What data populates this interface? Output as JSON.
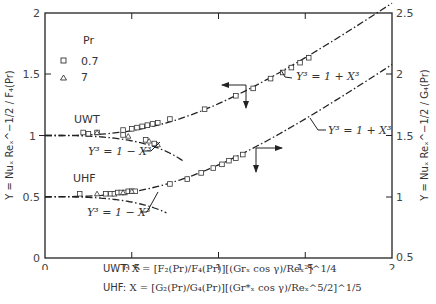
{
  "chart_data": {
    "type": "scatter",
    "title": "",
    "xlabel": "X",
    "ylabel_left": "Y = Nu_x Re_x^{-1/2} / F_4(Pr)",
    "ylabel_right": "Y = Nu_x Re_x^{-1/2} / G_4(Pr)",
    "xlim": [
      0,
      2
    ],
    "ylim_left": [
      0,
      2
    ],
    "ylim_right": [
      0.5,
      2.5
    ],
    "x_ticks": [
      "0",
      "0.5",
      "1",
      "1.5",
      "2"
    ],
    "y_ticks_left": [
      "0",
      "0.5",
      "1",
      "1.5",
      "2"
    ],
    "y_ticks_right": [
      "0.5",
      "1",
      "1.5",
      "2",
      "2.5"
    ],
    "legend": {
      "title": "Pr",
      "entries": [
        {
          "marker": "square",
          "label": "0.7"
        },
        {
          "marker": "triangle",
          "label": "7"
        }
      ]
    },
    "curves": [
      {
        "name": "UWT: Y^3 = 1 + X^3",
        "axis": "left",
        "style": "dash-dot",
        "formula": "Y=(1+X^3)^(1/3)",
        "x_range": [
          0,
          2
        ]
      },
      {
        "name": "UWT: Y^3 = 1 - X^3",
        "axis": "left",
        "style": "dash-dot",
        "formula": "Y=(1-X^3)^(1/3)",
        "x_range": [
          0,
          0.8
        ]
      },
      {
        "name": "UHF: Y^3 = 1 + X^3",
        "axis": "right",
        "style": "dash-dot",
        "formula": "Y=(1+X^3)^(1/3)",
        "x_range": [
          0,
          2
        ]
      },
      {
        "name": "UHF: Y^3 = 1 - X^3",
        "axis": "right",
        "style": "dash-dot",
        "formula": "Y=(1-X^3)^(1/3)",
        "x_range": [
          0,
          0.7
        ]
      }
    ],
    "series": [
      {
        "name": "UWT aiding, Pr=0.7",
        "axis": "left",
        "marker": "square",
        "x": [
          0.22,
          0.3,
          0.45,
          0.5,
          0.53,
          0.56,
          0.59,
          0.62,
          0.65,
          0.72,
          0.92,
          1.1,
          1.2,
          1.3,
          1.37,
          1.42,
          1.47,
          1.52
        ],
        "y": [
          1.0,
          1.0,
          1.02,
          1.03,
          1.04,
          1.05,
          1.06,
          1.07,
          1.08,
          1.11,
          1.19,
          1.3,
          1.36,
          1.44,
          1.49,
          1.53,
          1.57,
          1.61
        ]
      },
      {
        "name": "UWT opposing, Pr=0.7",
        "axis": "left",
        "marker": "square",
        "x": [
          0.25,
          0.45,
          0.58,
          0.63
        ],
        "y": [
          0.99,
          0.98,
          0.94,
          0.91
        ]
      },
      {
        "name": "UWT opposing, Pr=7",
        "axis": "left",
        "marker": "triangle",
        "x": [
          0.3,
          0.48,
          0.6,
          0.65
        ],
        "y": [
          1.0,
          0.97,
          0.93,
          0.9
        ]
      },
      {
        "name": "UHF aiding, Pr=0.7",
        "axis": "right",
        "marker": "square",
        "x": [
          0.2,
          0.35,
          0.38,
          0.4,
          0.42,
          0.44,
          0.46,
          0.48,
          0.5,
          0.52,
          0.72,
          0.82,
          0.9,
          0.97,
          1.02,
          1.06,
          1.1,
          1.14
        ],
        "y": [
          1.0,
          1.0,
          1.0,
          1.0,
          1.01,
          1.01,
          1.01,
          1.02,
          1.02,
          1.02,
          1.08,
          1.12,
          1.17,
          1.21,
          1.24,
          1.27,
          1.29,
          1.32
        ]
      },
      {
        "name": "UHF, Pr=7",
        "axis": "right",
        "marker": "triangle",
        "x": [
          0.3,
          0.45,
          0.5
        ],
        "y": [
          1.0,
          1.01,
          1.02
        ]
      }
    ],
    "annotations": [
      {
        "text": "UWT",
        "x": 0.05,
        "y": 1.1
      },
      {
        "text": "UHF",
        "x": 0.05,
        "y": 0.6
      },
      {
        "text": "Y^3 = 1 - X^3",
        "near": "UWT opposing curve"
      },
      {
        "text": "Y^3 = 1 - X^3",
        "near": "UHF opposing curve"
      },
      {
        "text": "Y^3 = 1 + X^3",
        "near": "UWT aiding curve"
      },
      {
        "text": "Y^3 = 1 + X^3",
        "near": "UHF aiding curve"
      },
      {
        "text": "arrows",
        "note": "left arrow on UWT curve points to left axis; right arrow on UHF curve points to right axis"
      }
    ],
    "grid": false
  },
  "labels": {
    "legend_title": "Pr",
    "legend_sq": "0.7",
    "legend_tri": "7",
    "uwt": "UWT",
    "uhf": "UHF",
    "eq_minus": "Y³ = 1 − X³",
    "eq_plus": "Y³ = 1 + X³",
    "ylabel_left": "Y = Nuₓ Reₓ^−1/2 / F₄(Pr)",
    "ylabel_right": "Y = Nuₓ Reₓ^−1/2 / G₄(Pr)"
  },
  "caption": {
    "uwt_prefix": "UWT:",
    "uwt_formula": "X = [F₂(Pr)/F₄(Pr)][(Grₓ cos γ)/Reₓ²]^1/4",
    "uhf_prefix": "UHF:",
    "uhf_formula": "X = [G₂(Pr)/G₄(Pr)][(Gr*ₓ cos γ)/Reₓ^5/2]^1/5"
  }
}
